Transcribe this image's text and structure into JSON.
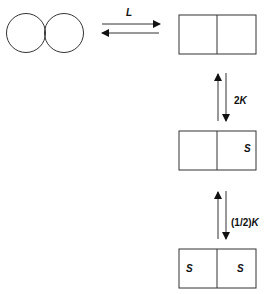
{
  "diagram": {
    "equilibrium_label": "L",
    "step1_label_num": "2",
    "step1_label_k": "K",
    "step2_label_frac": "(1/2)",
    "step2_label_k": "K",
    "state2": {
      "left": "",
      "right": "S"
    },
    "state3": {
      "left": "S",
      "right": "S"
    },
    "stroke_color": "#333333"
  }
}
